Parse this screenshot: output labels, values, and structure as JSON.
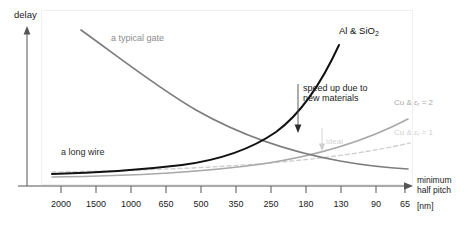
{
  "chart_data": {
    "type": "line",
    "title": "",
    "xlabel": "minimum half pitch [nm]",
    "xlabel_line1": "minimum",
    "xlabel_line2": "half pitch",
    "xlabel_unit": "[nm]",
    "ylabel": "delay",
    "grid": false,
    "legend_position": "inline-annotations",
    "categories": [
      "2000",
      "1500",
      "1000",
      "650",
      "500",
      "350",
      "250",
      "180",
      "130",
      "90",
      "65"
    ],
    "x_tick_labels": [
      "2000",
      "1500",
      "1000",
      "650",
      "500",
      "350",
      "250",
      "180",
      "130",
      "90",
      "65"
    ],
    "y_tick_labels": [],
    "ylim": [
      0,
      1
    ],
    "series": [
      {
        "name": "a typical gate",
        "label": "a typical gate",
        "color": "#7d7d7d",
        "style": "solid",
        "width": 1.6,
        "points": [
          [
            0.14,
            0.07
          ],
          [
            0.22,
            0.16
          ],
          [
            0.32,
            0.3
          ],
          [
            0.44,
            0.46
          ],
          [
            0.56,
            0.61
          ],
          [
            0.68,
            0.72
          ],
          [
            0.8,
            0.8
          ],
          [
            0.92,
            0.855
          ],
          [
            1.0,
            0.88
          ]
        ],
        "description": "gate delay decreases as half pitch shrinks"
      },
      {
        "name": "Al & SiO2",
        "label": "Al & SiO₂",
        "color": "#111111",
        "style": "solid",
        "width": 2.0,
        "points": [
          [
            0.0,
            0.915
          ],
          [
            0.12,
            0.905
          ],
          [
            0.25,
            0.885
          ],
          [
            0.38,
            0.855
          ],
          [
            0.5,
            0.805
          ],
          [
            0.6,
            0.745
          ],
          [
            0.7,
            0.655
          ],
          [
            0.78,
            0.555
          ],
          [
            0.85,
            0.44
          ],
          [
            0.9,
            0.33
          ],
          [
            0.94,
            0.22
          ]
        ],
        "description": "interconnect delay with Al and SiO2 rises sharply"
      },
      {
        "name": "a long wire",
        "label": "a long wire",
        "color": "#2b2b2b",
        "style": "solid",
        "width": 2.0,
        "description": "left flat portion of the Al & SiO2 curve"
      },
      {
        "name": "Cu & er = 2",
        "label": "Cu & εr = 2",
        "label_prefix": "Cu & ",
        "label_sub": "r",
        "label_suffix": " = 2",
        "color": "#a8a8a8",
        "style": "solid",
        "width": 1.5,
        "points": [
          [
            0.0,
            0.925
          ],
          [
            0.2,
            0.915
          ],
          [
            0.4,
            0.895
          ],
          [
            0.58,
            0.865
          ],
          [
            0.72,
            0.825
          ],
          [
            0.84,
            0.775
          ],
          [
            0.92,
            0.725
          ],
          [
            1.0,
            0.665
          ]
        ],
        "description": "interconnect delay with Cu and low-k dielectric"
      },
      {
        "name": "Cu & er = 1",
        "label": "Cu & εr = 1",
        "label_prefix": "Cu & ",
        "label_sub": "r",
        "label_suffix": " = 1",
        "color": "#cfcfcf",
        "style": "dashed",
        "width": 1.4,
        "points": [
          [
            0.0,
            0.945
          ],
          [
            0.2,
            0.94
          ],
          [
            0.4,
            0.928
          ],
          [
            0.58,
            0.908
          ],
          [
            0.72,
            0.882
          ],
          [
            0.84,
            0.85
          ],
          [
            0.92,
            0.82
          ],
          [
            1.0,
            0.785
          ]
        ],
        "description": "ideal interconnect limit, dashed light gray"
      }
    ],
    "annotations": [
      {
        "name": "speed-up-due-to-new-materials",
        "text_line1": "speed up due to",
        "text_line2": "new materials",
        "arrow": "down",
        "color": "#1a1a1a"
      },
      {
        "name": "ideal",
        "text": "ideal",
        "arrow": "down",
        "color": "#d4d4d4"
      }
    ]
  },
  "axes": {
    "y_title": "delay",
    "x_title_line1": "minimum",
    "x_title_line2": "half pitch",
    "x_unit": "[nm]"
  },
  "labels": {
    "gate": "a typical gate",
    "al_sio2_prefix": "Al & SiO",
    "al_sio2_sub": "2",
    "long_wire": "a long wire",
    "speedup_line1": "speed up due to",
    "speedup_line2": "new materials",
    "cu_er2_prefix": "Cu & ",
    "cu_er2_eps": "ε",
    "cu_er2_sub": "r",
    "cu_er2_suffix": " = 2",
    "cu_er1_prefix": "Cu & ",
    "cu_er1_eps": "ε",
    "cu_er1_sub": "r",
    "cu_er1_suffix": " = 1",
    "ideal": "ideal"
  },
  "colors": {
    "black_curve": "#111111",
    "gray_curve": "#7d7d7d",
    "cu_er2": "#a8a8a8",
    "cu_er1": "#cfcfcf",
    "axis": "#555555",
    "frame": "#ededed"
  }
}
